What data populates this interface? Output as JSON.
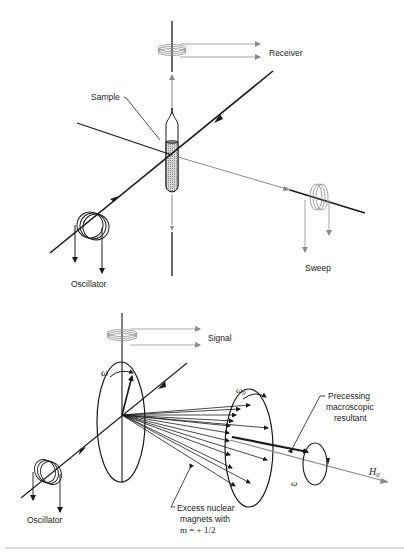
{
  "figure_top": {
    "title": "NMR apparatus schematic",
    "labels": {
      "receiver": "Receiver",
      "sample": "Sample",
      "oscillator": "Oscillator",
      "sweep": "Sweep"
    }
  },
  "figure_bottom": {
    "title": "Nuclear magnet precession",
    "labels": {
      "signal": "Signal",
      "omega_left": "ω",
      "omega0": "ω",
      "omega0_sub": "0",
      "precessing": [
        "Precessing",
        "macroscopic",
        "resultant"
      ],
      "h0": "H",
      "h0_sub": "0",
      "omega_right": "ω",
      "oscillator": "Oscillator",
      "excess": [
        "Excess nuclear",
        "magnets with",
        "m = + 1/2"
      ]
    }
  },
  "colors": {
    "ink": "#1a1a1a",
    "gray": "#8a8a8a",
    "background": "#ffffff"
  }
}
